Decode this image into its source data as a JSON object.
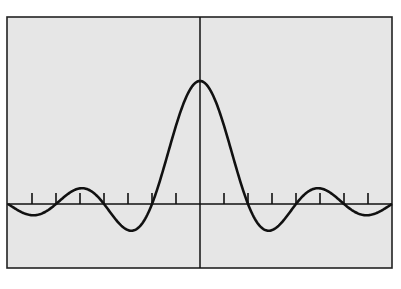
{
  "chart_data": {
    "type": "line",
    "title": "",
    "xlabel": "",
    "ylabel": "",
    "function": "y = sin(x)/x",
    "xlim": [
      -12.566,
      12.566
    ],
    "ylim": [
      -0.5,
      1.05
    ],
    "grid": false,
    "legend": null,
    "x_tick_spacing": 1.5708,
    "x_ticks_count_each_side": 7,
    "series": [
      {
        "name": "sinc",
        "x": [
          -12.566,
          -10.996,
          -9.425,
          -7.725,
          -6.283,
          -4.493,
          -3.142,
          -1.571,
          0,
          1.571,
          3.142,
          4.493,
          6.283,
          7.725,
          9.425,
          10.996,
          12.566
        ],
        "values": [
          0,
          -0.091,
          0,
          0.128,
          0,
          -0.217,
          0,
          0.637,
          1.0,
          0.637,
          0,
          -0.217,
          0,
          0.128,
          0,
          -0.091,
          0
        ]
      }
    ]
  },
  "style": {
    "background": "#e6e6e6",
    "frame_color": "#222222",
    "curve_color": "#111111",
    "axis_color": "#111111"
  }
}
